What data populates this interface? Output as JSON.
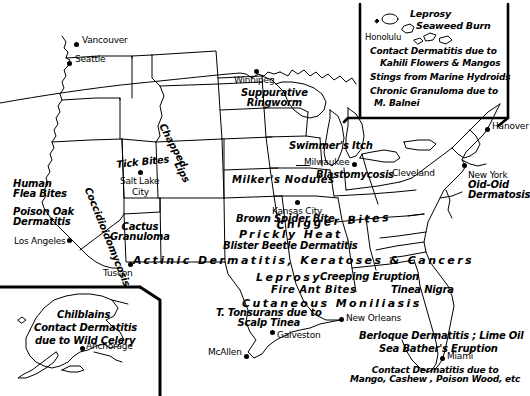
{
  "map": {
    "title": "Dermatologic Geography of North America",
    "type": "annotated-outline-map",
    "width": 530,
    "height": 396,
    "background_color": "#ffffff",
    "ink_color": "#000000"
  },
  "cities": [
    {
      "name": "Vancouver",
      "dot_x": 77,
      "dot_y": 44,
      "label_x": 83,
      "label_y": 38,
      "size": 9
    },
    {
      "name": "Seattle",
      "dot_x": 70,
      "dot_y": 63,
      "label_x": 76,
      "label_y": 57,
      "size": 9
    },
    {
      "name": "Winnipeg",
      "dot_x": 256,
      "dot_y": 71,
      "label_x": 258,
      "label_y": 76,
      "size": 9
    },
    {
      "name": "Honolulu",
      "dot_x": 0,
      "dot_y": 0,
      "label_x": 388,
      "label_y": 34,
      "size": 8
    },
    {
      "name": "Hanover",
      "dot_x": 488,
      "dot_y": 129,
      "label_x": 494,
      "label_y": 124,
      "size": 9
    },
    {
      "name": "Milwaukee",
      "dot_x": 355,
      "dot_y": 164,
      "label_x": 309,
      "label_y": 159,
      "size": 9
    },
    {
      "name": "Cleveland",
      "dot_x": 0,
      "dot_y": 0,
      "label_x": 395,
      "label_y": 170,
      "size": 9
    },
    {
      "name": "New York",
      "dot_x": 465,
      "dot_y": 168,
      "label_x": 470,
      "label_y": 172,
      "size": 9
    },
    {
      "name": "Salt Lake",
      "dot_x": 141,
      "dot_y": 172,
      "label_x": 124,
      "label_y": 176,
      "size": 9
    },
    {
      "name": "City",
      "dot_x": 0,
      "dot_y": 0,
      "label_x": 133,
      "label_y": 186,
      "size": 9
    },
    {
      "name": "Kansas City",
      "dot_x": 298,
      "dot_y": 203,
      "label_x": 273,
      "label_y": 207,
      "size": 9
    },
    {
      "name": "Los Angeles",
      "dot_x": 70,
      "dot_y": 240,
      "label_x": 16,
      "label_y": 238,
      "size": 9
    },
    {
      "name": "Tuscon",
      "dot_x": 131,
      "dot_y": 264,
      "label_x": 107,
      "label_y": 268,
      "size": 9
    },
    {
      "name": "New Orleans",
      "dot_x": 342,
      "dot_y": 319,
      "label_x": 348,
      "label_y": 315,
      "size": 9
    },
    {
      "name": "Galveston",
      "dot_x": 273,
      "dot_y": 332,
      "label_x": 279,
      "label_y": 332,
      "size": 9
    },
    {
      "name": "Miami",
      "dot_x": 443,
      "dot_y": 358,
      "label_x": 449,
      "label_y": 353,
      "size": 9
    },
    {
      "name": "McAllen",
      "dot_x": 247,
      "dot_y": 356,
      "label_x": 211,
      "label_y": 349,
      "size": 9
    },
    {
      "name": "Anchorage",
      "dot_x": 83,
      "dot_y": 348,
      "label_x": 88,
      "label_y": 343,
      "size": 9
    }
  ],
  "condition_labels": [
    {
      "id": "suppurative-ringworm",
      "lines": [
        "Suppurative",
        "Ringworm"
      ],
      "x": 247,
      "y": 92,
      "size": 10,
      "rotate": 0,
      "style": "italic",
      "align": "center"
    },
    {
      "id": "swimmers-itch",
      "lines": [
        "Swimmer's Itch"
      ],
      "x": 291,
      "y": 145,
      "size": 10,
      "rotate": 0,
      "style": "italic",
      "align": "left"
    },
    {
      "id": "chapped-lips",
      "lines": [
        "Chapped",
        "Lips"
      ],
      "x": 162,
      "y": 128,
      "size": 10,
      "rotate": 62,
      "style": "italic",
      "align": "left"
    },
    {
      "id": "tick-bites",
      "lines": [
        "Tick Bites"
      ],
      "x": 119,
      "y": 163,
      "size": 10,
      "rotate": -6,
      "style": "italic",
      "align": "left"
    },
    {
      "id": "milkers-nodules",
      "lines": [
        "Milker's Nodules"
      ],
      "x": 235,
      "y": 178,
      "size": 10,
      "rotate": 0,
      "style": "italic",
      "align": "left"
    },
    {
      "id": "blastomycosis",
      "lines": [
        "Blastomycosis"
      ],
      "x": 318,
      "y": 173,
      "size": 10,
      "rotate": 0,
      "style": "italic",
      "align": "left"
    },
    {
      "id": "human-flea-bites",
      "lines": [
        "Human",
        "Flea Bites"
      ],
      "x": 14,
      "y": 182,
      "size": 10,
      "rotate": 0,
      "style": "italic",
      "align": "left"
    },
    {
      "id": "poison-oak-dermatitis",
      "lines": [
        "Poison Oak",
        "Dermatitis"
      ],
      "x": 14,
      "y": 210,
      "size": 10,
      "rotate": 0,
      "style": "italic",
      "align": "left"
    },
    {
      "id": "coccidioidomycosis",
      "lines": [
        "Coccidioidomycosis"
      ],
      "x": 90,
      "y": 188,
      "size": 10,
      "rotate": 68,
      "style": "italic",
      "align": "left"
    },
    {
      "id": "cactus-granuloma",
      "lines": [
        "Cactus",
        "Granuloma"
      ],
      "x": 113,
      "y": 225,
      "size": 10,
      "rotate": 0,
      "style": "italic",
      "align": "center"
    },
    {
      "id": "new-york-oid-oid",
      "lines": [
        "Oid-Oid",
        "Dermatosis"
      ],
      "x": 470,
      "y": 182,
      "size": 10,
      "rotate": 0,
      "style": "italic",
      "align": "left"
    },
    {
      "id": "brown-spider-bite",
      "lines": [
        "Brown Spider Bite"
      ],
      "x": 239,
      "y": 217,
      "size": 10,
      "rotate": 0,
      "style": "italic",
      "align": "left"
    },
    {
      "id": "chigger-bites",
      "lines": [
        "Chigger Bites"
      ],
      "x": 278,
      "y": 224,
      "size": 11,
      "rotate": -4,
      "style": "wide",
      "align": "left"
    },
    {
      "id": "prickly-heat",
      "lines": [
        "Prickly Heat"
      ],
      "x": 241,
      "y": 232,
      "size": 11,
      "rotate": 0,
      "style": "wide",
      "align": "left"
    },
    {
      "id": "blister-beetle",
      "lines": [
        "Blister Beetle Dermatitis"
      ],
      "x": 226,
      "y": 244,
      "size": 10,
      "rotate": 0,
      "style": "italic",
      "align": "left"
    },
    {
      "id": "actinic-dermatitis",
      "lines": [
        "Actinic Dermatitis, Keratoses & Cancers"
      ],
      "x": 135,
      "y": 258,
      "size": 11,
      "rotate": 0,
      "style": "wide",
      "align": "left"
    },
    {
      "id": "leprosy-south",
      "lines": [
        "Leprosy"
      ],
      "x": 258,
      "y": 275,
      "size": 11,
      "rotate": 0,
      "style": "wide",
      "align": "left"
    },
    {
      "id": "creeping-eruption",
      "lines": [
        "Creeping Eruption"
      ],
      "x": 322,
      "y": 275,
      "size": 10,
      "rotate": 0,
      "style": "italic",
      "align": "left"
    },
    {
      "id": "fire-ant-bites",
      "lines": [
        "Fire Ant Bites"
      ],
      "x": 273,
      "y": 288,
      "size": 10,
      "rotate": 0,
      "style": "italic",
      "align": "left"
    },
    {
      "id": "tinea-nigra",
      "lines": [
        "Tinea Nigra"
      ],
      "x": 393,
      "y": 288,
      "size": 10,
      "rotate": 0,
      "style": "italic",
      "align": "left"
    },
    {
      "id": "cutaneous-moniliasis",
      "lines": [
        "Cutaneous  Moniliasis"
      ],
      "x": 244,
      "y": 301,
      "size": 11,
      "rotate": 0,
      "style": "wide",
      "align": "left"
    },
    {
      "id": "t-tonsurans",
      "lines": [
        "T. Tonsurans due to",
        "Scalp Tinea"
      ],
      "x": 219,
      "y": 311,
      "size": 10,
      "rotate": 0,
      "style": "italic",
      "align": "center"
    },
    {
      "id": "berloque-dermatitis",
      "lines": [
        "Berloque Dermatitis ; Lime Oil"
      ],
      "x": 361,
      "y": 334,
      "size": 10,
      "rotate": 0,
      "style": "italic",
      "align": "left"
    },
    {
      "id": "sea-bathers-eruption",
      "lines": [
        "Sea Bather's Eruption"
      ],
      "x": 381,
      "y": 347,
      "size": 10,
      "rotate": 0,
      "style": "italic",
      "align": "left"
    },
    {
      "id": "florida-contact-derm",
      "lines": [
        "Contact Dermatitis due to",
        "Mango, Cashew , Poison Wood, etc"
      ],
      "x": 356,
      "y": 369,
      "size": 9,
      "rotate": 0,
      "style": "italic",
      "align": "center"
    }
  ],
  "hawaii_inset": {
    "id": "hawaii-inset",
    "labels": [
      {
        "id": "leprosy-hawaii",
        "text": "Leprosy",
        "x": 412,
        "y": 12,
        "size": 10,
        "align": "left"
      },
      {
        "id": "seaweed-burn",
        "text": "Seaweed Burn",
        "x": 418,
        "y": 24,
        "size": 10,
        "align": "left"
      },
      {
        "id": "hawaii-contact-derm",
        "text": "Contact Dermatitis due to",
        "x": 372,
        "y": 50,
        "size": 9,
        "align": "left"
      },
      {
        "id": "hawaii-kahili",
        "text": "Kahili Flowers & Mangos",
        "x": 382,
        "y": 62,
        "size": 9,
        "align": "left"
      },
      {
        "id": "marine-hydroids",
        "text": "Stings from Marine Hydroids",
        "x": 372,
        "y": 76,
        "size": 9,
        "align": "left"
      },
      {
        "id": "chronic-granuloma",
        "text": "Chronic Granuloma due to",
        "x": 372,
        "y": 90,
        "size": 9,
        "align": "left"
      },
      {
        "id": "m-balnei",
        "text": "M. Balnei",
        "x": 376,
        "y": 102,
        "size": 9,
        "align": "left"
      }
    ]
  },
  "alaska_inset": {
    "id": "alaska-inset",
    "labels": [
      {
        "id": "chilblains",
        "text": "Chilblains",
        "x": 59,
        "y": 313,
        "size": 10,
        "align": "left"
      },
      {
        "id": "alaska-contact-derm",
        "text": "Contact Dermatitis",
        "x": 36,
        "y": 326,
        "size": 10,
        "align": "left"
      },
      {
        "id": "alaska-wild-celery",
        "text": "due to Wild Celery",
        "x": 37,
        "y": 339,
        "size": 10,
        "align": "left"
      }
    ]
  }
}
